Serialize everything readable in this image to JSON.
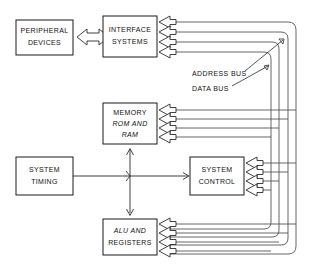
{
  "diagram": {
    "background_color": "#ffffff",
    "line_color": "#555555",
    "box_stroke_color": "#1a1a1a",
    "text_color": "#111111",
    "boxes": [
      {
        "id": "peripheral-devices",
        "lines": [
          "PERIPHERAL",
          "DEVICES"
        ],
        "italic_lines": [],
        "x": 16,
        "y": 20,
        "w": 57,
        "h": 35
      },
      {
        "id": "interface-systems",
        "lines": [
          "INTERFACE",
          "SYSTEMS"
        ],
        "italic_lines": [],
        "x": 103,
        "y": 16,
        "w": 54,
        "h": 41
      },
      {
        "id": "memory-rom-and-ram",
        "lines": [
          "MEMORY",
          "ROM AND",
          "RAM"
        ],
        "italic_lines": [
          "ROM",
          "RAM"
        ],
        "x": 103,
        "y": 103,
        "w": 54,
        "h": 41
      },
      {
        "id": "system-timing",
        "lines": [
          "SYSTEM",
          "TIMING"
        ],
        "italic_lines": [],
        "x": 16,
        "y": 157,
        "w": 57,
        "h": 38
      },
      {
        "id": "system-control",
        "lines": [
          "SYSTEM",
          "CONTROL"
        ],
        "italic_lines": [],
        "x": 190,
        "y": 157,
        "w": 54,
        "h": 38
      },
      {
        "id": "alu-and-registers",
        "lines": [
          "ALU AND",
          "REGISTERS"
        ],
        "italic_lines": [
          "ALU"
        ],
        "x": 103,
        "y": 219,
        "w": 54,
        "h": 36
      }
    ],
    "bus_labels": [
      {
        "id": "address-bus",
        "text": "ADDRESS BUS",
        "x": 192,
        "y": 74
      },
      {
        "id": "data-bus",
        "text": "DATA BUS",
        "x": 192,
        "y": 89
      }
    ]
  }
}
